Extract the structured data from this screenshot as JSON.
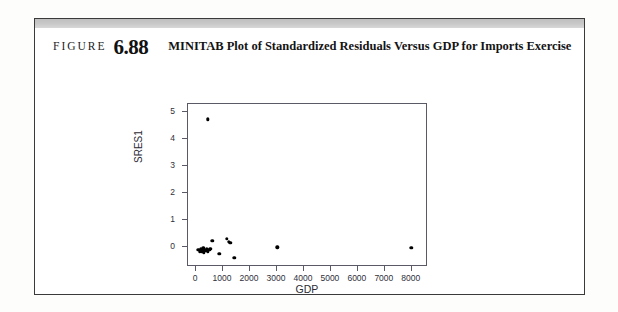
{
  "figure": {
    "label": "FIGURE",
    "number": "6.88",
    "title": "MINITAB Plot of Standardized Residuals Versus GDP for Imports Exercise"
  },
  "chart_data": {
    "type": "scatter",
    "title": "",
    "xlabel": "GDP",
    "ylabel": "SRES1",
    "xlim": [
      -300,
      8600
    ],
    "ylim": [
      -0.75,
      5.3
    ],
    "xticks": [
      0,
      1000,
      2000,
      3000,
      4000,
      5000,
      6000,
      7000,
      8000
    ],
    "xtick_labels": [
      "0",
      "1000",
      "2000",
      "3000",
      "4000",
      "5000",
      "6000",
      "7000",
      "8000"
    ],
    "yticks": [
      0,
      1,
      2,
      3,
      4,
      5
    ],
    "ytick_labels": [
      "0",
      "1",
      "2",
      "3",
      "4",
      "5"
    ],
    "grid": false,
    "legend": "none",
    "marker": "filled-circle",
    "marker_color": "#000000",
    "points": [
      {
        "x": 480,
        "y": 4.7
      },
      {
        "x": 120,
        "y": -0.16
      },
      {
        "x": 170,
        "y": -0.2
      },
      {
        "x": 205,
        "y": -0.12
      },
      {
        "x": 240,
        "y": -0.22
      },
      {
        "x": 270,
        "y": -0.17
      },
      {
        "x": 300,
        "y": -0.1
      },
      {
        "x": 330,
        "y": -0.24
      },
      {
        "x": 360,
        "y": -0.14
      },
      {
        "x": 400,
        "y": -0.19
      },
      {
        "x": 440,
        "y": -0.13
      },
      {
        "x": 470,
        "y": -0.21
      },
      {
        "x": 520,
        "y": -0.15
      },
      {
        "x": 560,
        "y": -0.11
      },
      {
        "x": 640,
        "y": 0.18
      },
      {
        "x": 900,
        "y": -0.3
      },
      {
        "x": 1180,
        "y": 0.26
      },
      {
        "x": 1260,
        "y": 0.14
      },
      {
        "x": 1300,
        "y": 0.1
      },
      {
        "x": 1460,
        "y": -0.44
      },
      {
        "x": 3050,
        "y": -0.06
      },
      {
        "x": 8020,
        "y": -0.07
      }
    ]
  }
}
